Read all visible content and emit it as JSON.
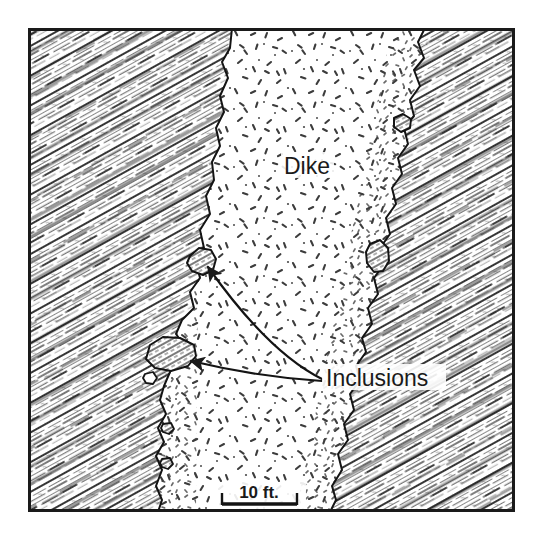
{
  "figure": {
    "kind": "geologic-map-diagram",
    "background_color": "#ffffff",
    "ink_color": "#1a1a1a"
  },
  "frame": {
    "x": 28,
    "y": 28,
    "width": 487,
    "height": 484,
    "stroke_color": "#1a1a1a",
    "stroke_width": 3
  },
  "labels": {
    "dike": {
      "text": "Dike",
      "x": 307,
      "y": 174,
      "anchor": "middle"
    },
    "inclusions": {
      "text": "Inclusions",
      "x": 326,
      "y": 386,
      "anchor": "start"
    }
  },
  "scale_bar": {
    "text": "10 ft.",
    "label_x": 259,
    "label_y": 498,
    "bar_y": 504,
    "x_start": 222,
    "x_end": 297,
    "tick_height": 11,
    "bar_thickness": 3,
    "length_feet": 10,
    "units": "ft."
  },
  "leader_arrows": [
    {
      "name": "arrow-to-upper-inclusion",
      "from_x": 322,
      "from_y": 379,
      "ctrl_x": 268,
      "ctrl_y": 352,
      "to_x": 207,
      "to_y": 266
    },
    {
      "name": "arrow-to-lower-inclusion",
      "from_x": 322,
      "from_y": 381,
      "ctrl_x": 258,
      "ctrl_y": 377,
      "to_x": 189,
      "to_y": 360
    }
  ],
  "units": [
    {
      "name": "country-rock-left",
      "pattern": "diagonal-foliation-hatching",
      "dip_direction": "NE-striking foliation, ~30 degrees from horizontal",
      "tone": "dark-grey"
    },
    {
      "name": "country-rock-right",
      "pattern": "diagonal-foliation-hatching",
      "dip_direction": "NE-striking foliation, ~30 degrees from horizontal",
      "tone": "dark-grey"
    },
    {
      "name": "dike-body",
      "pattern": "random-fleck-stipple",
      "tone": "light"
    }
  ],
  "inclusions": [
    {
      "name": "inclusion-left-upper",
      "cx": 201,
      "cy": 262,
      "rx": 14,
      "ry": 12
    },
    {
      "name": "inclusion-left-lower",
      "cx": 172,
      "cy": 355,
      "rx": 24,
      "ry": 16
    },
    {
      "name": "inclusion-left-small",
      "cx": 150,
      "cy": 378,
      "rx": 6,
      "ry": 6
    },
    {
      "name": "inclusion-right-upper",
      "cx": 402,
      "cy": 123,
      "rx": 9,
      "ry": 8
    },
    {
      "name": "inclusion-right-middle",
      "cx": 378,
      "cy": 256,
      "rx": 11,
      "ry": 16
    },
    {
      "name": "inclusion-bottom-left-a",
      "cx": 168,
      "cy": 428,
      "rx": 6,
      "ry": 5
    },
    {
      "name": "inclusion-bottom-left-b",
      "cx": 167,
      "cy": 463,
      "rx": 6,
      "ry": 5
    }
  ],
  "contacts": {
    "left_margin_points": "232,28 230,48 222,62 228,78 220,96 224,112 216,128 220,146 212,162 214,180 206,196 210,214 200,230 204,248 196,262 200,278 190,292 194,308 182,320 176,334 186,348 178,360 170,372 164,386 160,400 166,414 158,428 164,442 156,456 162,470 156,486 162,500 158,512",
    "right_margin_points": "425,28 418,42 424,58 414,70 420,86 410,100 414,116 404,128 408,144 398,158 402,174 392,188 396,204 386,218 390,234 380,248 384,264 374,278 378,294 368,308 372,324 362,338 366,352 356,366 360,380 350,394 354,410 344,424 348,440 338,454 342,470 332,486 336,500 330,512"
  }
}
